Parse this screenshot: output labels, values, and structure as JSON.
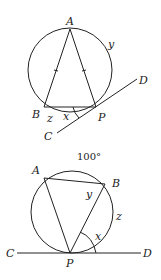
{
  "figures": [
    {
      "name": "isosceles-triangle-tangent",
      "labels": {
        "A": "A",
        "B": "B",
        "P": "P",
        "C": "C",
        "D": "D",
        "x": "x",
        "y": "y",
        "z": "z"
      }
    },
    {
      "name": "inscribed-triangle-tangent",
      "labels": {
        "A": "A",
        "B": "B",
        "P": "P",
        "C": "C",
        "D": "D",
        "x": "x",
        "y": "y",
        "z": "z",
        "arc": "100°"
      }
    }
  ],
  "colors": {
    "stroke": "#222222",
    "background": "#ffffff"
  }
}
